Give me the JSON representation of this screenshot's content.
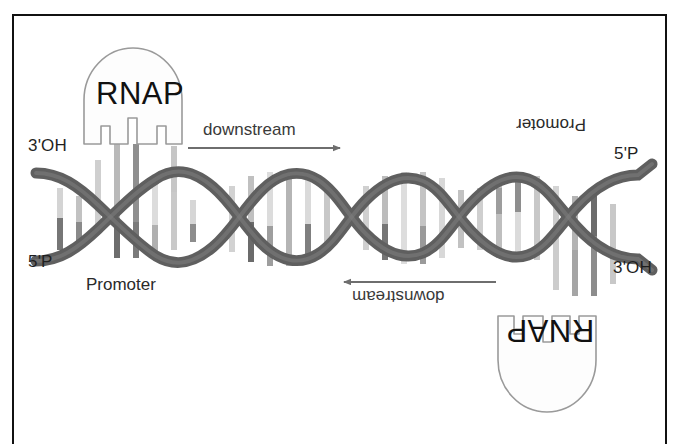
{
  "figure": {
    "background_color": "#ffffff",
    "frame_color": "#111111"
  },
  "enzymes": [
    {
      "id": "rnap-top",
      "label": "RNAP",
      "orientation": "upright",
      "position": "upper-left",
      "body_color": "#fdfdfd",
      "outline_color": "#8b8b8b"
    },
    {
      "id": "rnap-bottom",
      "label": "RNAP",
      "orientation": "rotated-180",
      "position": "lower-right",
      "body_color": "#fdfdfd",
      "outline_color": "#8b8b8b"
    }
  ],
  "strand_ends": [
    {
      "id": "left-top",
      "label": "3'OH"
    },
    {
      "id": "left-bottom",
      "label": "5'P"
    },
    {
      "id": "right-top",
      "label": "5'P"
    },
    {
      "id": "right-bottom",
      "label": "3'OH"
    }
  ],
  "promoters": [
    {
      "id": "promoter-left",
      "label": "Promoter",
      "orientation": "upright"
    },
    {
      "id": "promoter-right",
      "label": "Promoter",
      "orientation": "rotated-180"
    }
  ],
  "direction_arrows": [
    {
      "id": "downstream-top",
      "label": "downstream",
      "points": "right",
      "orientation": "upright",
      "color": "#6e6e6e"
    },
    {
      "id": "downstream-bottom",
      "label": "downstream",
      "points": "left",
      "orientation": "rotated-180",
      "color": "#6e6e6e"
    }
  ],
  "helix": {
    "strand_color": "#5a5a5a",
    "strand_highlight": "#7e7e7e",
    "base_pair_colors": [
      "#d9d9d9",
      "#bdbdbd",
      "#9a9a9a",
      "#6f6f6f"
    ],
    "crossings": 6,
    "lobes": 5
  }
}
